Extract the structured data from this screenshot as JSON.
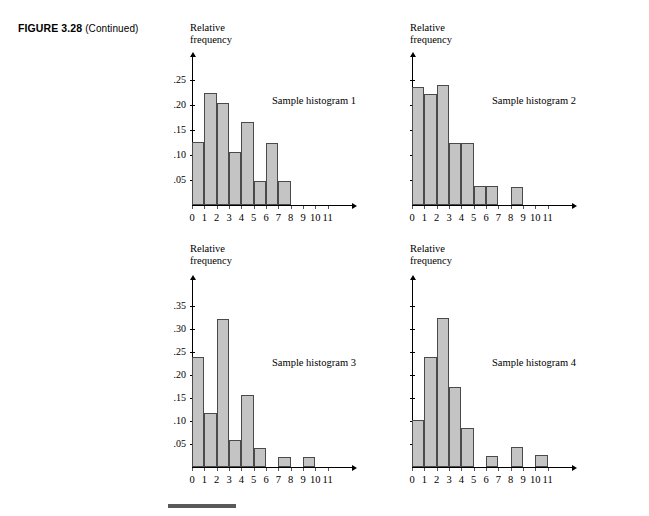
{
  "figure": {
    "number": "FIGURE 3.28",
    "continued": "(Continued)"
  },
  "common": {
    "y_axis_title_line1": "Relative",
    "y_axis_title_line2": "frequency",
    "x_tick_labels": [
      "0",
      "1",
      "2",
      "3",
      "4",
      "5",
      "6",
      "7",
      "8",
      "9",
      "10",
      "11"
    ],
    "bar_fill": "#c4c4c4",
    "bar_stroke": "#4a4a4a",
    "axis_color": "#000000"
  },
  "chart_data": [
    {
      "type": "bar",
      "title": "Sample histogram 1",
      "xlabel": "",
      "ylabel": "Relative frequency",
      "categories": [
        "0",
        "1",
        "2",
        "3",
        "4",
        "5",
        "6",
        "7",
        "8",
        "9",
        "10",
        "11"
      ],
      "bin_starts": [
        0,
        1,
        2,
        3,
        4,
        5,
        6,
        7,
        8,
        9,
        10,
        11
      ],
      "values": [
        0.125,
        0.2225,
        0.2025,
        0.105,
        0.165,
        0.048,
        0.124,
        0.048,
        0,
        0,
        0,
        0
      ],
      "y_tick_labels": [
        ".05",
        ".10",
        ".15",
        ".20",
        ".25"
      ],
      "y_tick_values": [
        0.05,
        0.1,
        0.15,
        0.2,
        0.25
      ],
      "ylim": [
        0,
        0.275
      ],
      "grid": false,
      "legend": "none"
    },
    {
      "type": "bar",
      "title": "Sample histogram 2",
      "xlabel": "",
      "ylabel": "Relative frequency",
      "categories": [
        "0",
        "1",
        "2",
        "3",
        "4",
        "5",
        "6",
        "7",
        "8",
        "9",
        "10",
        "11"
      ],
      "bin_starts": [
        0,
        1,
        2,
        3,
        4,
        5,
        6,
        7,
        8,
        9,
        10,
        11
      ],
      "values": [
        0.235,
        0.222,
        0.239,
        0.123,
        0.123,
        0.037,
        0.037,
        0,
        0.035,
        0,
        0,
        0
      ],
      "y_tick_labels": [
        "",
        "",
        "",
        "",
        ""
      ],
      "y_tick_values": [
        0.05,
        0.1,
        0.15,
        0.2,
        0.25
      ],
      "ylim": [
        0,
        0.275
      ],
      "grid": false,
      "legend": "none"
    },
    {
      "type": "bar",
      "title": "Sample histogram 3",
      "xlabel": "",
      "ylabel": "Relative frequency",
      "categories": [
        "0",
        "1",
        "2",
        "3",
        "4",
        "5",
        "6",
        "7",
        "8",
        "9",
        "10",
        "11"
      ],
      "bin_starts": [
        0,
        1,
        2,
        3,
        4,
        5,
        6,
        7,
        8,
        9,
        10,
        11
      ],
      "values": [
        0.24,
        0.118,
        0.322,
        0.058,
        0.156,
        0.042,
        0,
        0.021,
        0,
        0.021,
        0,
        0
      ],
      "y_tick_labels": [
        ".05",
        ".10",
        ".15",
        ".20",
        ".25",
        ".30",
        ".35"
      ],
      "y_tick_values": [
        0.05,
        0.1,
        0.15,
        0.2,
        0.25,
        0.3,
        0.35
      ],
      "ylim": [
        0,
        0.385
      ],
      "grid": false,
      "legend": "none"
    },
    {
      "type": "bar",
      "title": "Sample histogram 4",
      "xlabel": "",
      "ylabel": "Relative frequency",
      "categories": [
        "0",
        "1",
        "2",
        "3",
        "4",
        "5",
        "6",
        "7",
        "8",
        "9",
        "10",
        "11"
      ],
      "bin_starts": [
        0,
        1,
        2,
        3,
        4,
        5,
        6,
        7,
        8,
        9,
        10,
        11
      ],
      "values": [
        0.102,
        0.24,
        0.325,
        0.175,
        0.085,
        0,
        0.024,
        0,
        0.044,
        0,
        0.027,
        0
      ],
      "y_tick_labels": [
        "",
        "",
        "",
        "",
        "",
        "",
        ""
      ],
      "y_tick_values": [
        0.05,
        0.1,
        0.15,
        0.2,
        0.25,
        0.3,
        0.35
      ],
      "ylim": [
        0,
        0.385
      ],
      "grid": false,
      "legend": "none"
    }
  ]
}
